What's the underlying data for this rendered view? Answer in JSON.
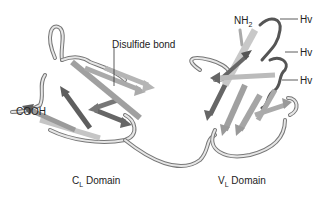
{
  "labels": {
    "disulfide": "Disulfide bond",
    "cooh": "COOH",
    "nh2_main": "NH",
    "nh2_sub": "2",
    "hv1": "Hv",
    "hv2": "Hv",
    "hv3": "Hv",
    "cl_main": "C",
    "cl_sub": "L",
    "cl_rest": " Domain",
    "vl_main": "V",
    "vl_sub": "L",
    "vl_rest": " Domain"
  },
  "colors": {
    "light_strand": "#c8c8c8",
    "mid_strand": "#9a9a9a",
    "dark_strand": "#5e5e5e",
    "hv_loop": "#555555",
    "outline": "#6f6f6f"
  }
}
